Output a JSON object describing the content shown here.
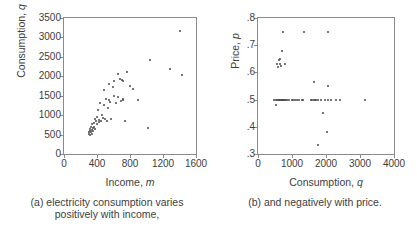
{
  "figure": {
    "panels": [
      {
        "id": "a",
        "caption_line1": "(a) electricity consumption varies",
        "caption_line2": "positively with income,",
        "y_axis_title_main": "Consumption,",
        "y_axis_title_var": "q",
        "x_axis_title_main": "Income,",
        "x_axis_title_var": "m"
      },
      {
        "id": "b",
        "caption_line1": "(b) and negatively with price.",
        "caption_line2": "",
        "y_axis_title_main": "Price,",
        "y_axis_title_var": "p",
        "x_axis_title_main": "Consumption,",
        "x_axis_title_var": "q"
      }
    ]
  },
  "chart_data": [
    {
      "type": "scatter",
      "panel": "a",
      "title": "(a) electricity consumption varies positively with income,",
      "xlabel": "Income, m",
      "ylabel": "Consumption, q",
      "xlim": [
        0,
        1600
      ],
      "ylim": [
        0,
        3500
      ],
      "xticks": [
        0,
        400,
        800,
        1200,
        1600
      ],
      "yticks": [
        0,
        500,
        1000,
        1500,
        2000,
        2500,
        3000,
        3500
      ],
      "xtick_labels": [
        "0",
        "400",
        "800",
        "1200",
        "1600"
      ],
      "ytick_labels": [
        "0",
        "500",
        "1000",
        "1500",
        "2000",
        "2500",
        "3000",
        "3500"
      ],
      "grid": false,
      "legend": null,
      "marker_color": "#4a4a4a",
      "points": [
        [
          300,
          560
        ],
        [
          305,
          520
        ],
        [
          310,
          600
        ],
        [
          315,
          480
        ],
        [
          318,
          640
        ],
        [
          322,
          560
        ],
        [
          330,
          700
        ],
        [
          335,
          620
        ],
        [
          340,
          520
        ],
        [
          345,
          760
        ],
        [
          350,
          660
        ],
        [
          355,
          580
        ],
        [
          360,
          800
        ],
        [
          365,
          700
        ],
        [
          370,
          900
        ],
        [
          380,
          640
        ],
        [
          390,
          860
        ],
        [
          395,
          760
        ],
        [
          400,
          960
        ],
        [
          410,
          1120
        ],
        [
          420,
          820
        ],
        [
          430,
          880
        ],
        [
          440,
          1320
        ],
        [
          450,
          860
        ],
        [
          460,
          1000
        ],
        [
          470,
          920
        ],
        [
          480,
          1640
        ],
        [
          490,
          1260
        ],
        [
          500,
          900
        ],
        [
          510,
          1420
        ],
        [
          520,
          860
        ],
        [
          530,
          1180
        ],
        [
          540,
          1800
        ],
        [
          550,
          1400
        ],
        [
          560,
          1340
        ],
        [
          575,
          900
        ],
        [
          590,
          1720
        ],
        [
          600,
          1500
        ],
        [
          610,
          1880
        ],
        [
          630,
          1300
        ],
        [
          650,
          1460
        ],
        [
          660,
          2060
        ],
        [
          680,
          1940
        ],
        [
          690,
          1360
        ],
        [
          700,
          1900
        ],
        [
          710,
          1880
        ],
        [
          715,
          1400
        ],
        [
          720,
          1420
        ],
        [
          740,
          840
        ],
        [
          760,
          2120
        ],
        [
          800,
          1760
        ],
        [
          840,
          1660
        ],
        [
          900,
          1400
        ],
        [
          1020,
          680
        ],
        [
          1040,
          2420
        ],
        [
          1280,
          2200
        ],
        [
          1400,
          3160
        ],
        [
          1430,
          2040
        ]
      ]
    },
    {
      "type": "scatter",
      "panel": "b",
      "title": "(b) and negatively with price.",
      "xlabel": "Consumption, q",
      "ylabel": "Price, p",
      "xlim": [
        0,
        4000
      ],
      "ylim": [
        0.3,
        0.8
      ],
      "xticks": [
        0,
        1000,
        2000,
        3000,
        4000
      ],
      "yticks": [
        0.3,
        0.4,
        0.5,
        0.6,
        0.7,
        0.8
      ],
      "xtick_labels": [
        "0",
        "1000",
        "2000",
        "3000",
        "4000"
      ],
      "ytick_labels": [
        ".3",
        ".4",
        ".5",
        ".6",
        ".7",
        ".8"
      ],
      "grid": false,
      "legend": null,
      "marker_color": "#4a4a4a",
      "points": [
        [
          480,
          0.5
        ],
        [
          520,
          0.5
        ],
        [
          540,
          0.48
        ],
        [
          560,
          0.5
        ],
        [
          600,
          0.5
        ],
        [
          620,
          0.5
        ],
        [
          640,
          0.5
        ],
        [
          660,
          0.5
        ],
        [
          680,
          0.5
        ],
        [
          700,
          0.5
        ],
        [
          720,
          0.5
        ],
        [
          740,
          0.5
        ],
        [
          760,
          0.5
        ],
        [
          790,
          0.5
        ],
        [
          820,
          0.5
        ],
        [
          860,
          0.5
        ],
        [
          900,
          0.5
        ],
        [
          1000,
          0.5
        ],
        [
          1040,
          0.5
        ],
        [
          1080,
          0.5
        ],
        [
          1160,
          0.5
        ],
        [
          1200,
          0.5
        ],
        [
          1280,
          0.5
        ],
        [
          1320,
          0.5
        ],
        [
          1560,
          0.5
        ],
        [
          1600,
          0.5
        ],
        [
          1640,
          0.5
        ],
        [
          1680,
          0.5
        ],
        [
          1720,
          0.5
        ],
        [
          1760,
          0.5
        ],
        [
          1840,
          0.5
        ],
        [
          1960,
          0.5
        ],
        [
          2060,
          0.5
        ],
        [
          2160,
          0.5
        ],
        [
          2300,
          0.5
        ],
        [
          2420,
          0.5
        ],
        [
          3160,
          0.5
        ],
        [
          560,
          0.63
        ],
        [
          580,
          0.62
        ],
        [
          620,
          0.645
        ],
        [
          640,
          0.65
        ],
        [
          660,
          0.63
        ],
        [
          680,
          0.625
        ],
        [
          700,
          0.68
        ],
        [
          780,
          0.63
        ],
        [
          740,
          0.75
        ],
        [
          1340,
          0.75
        ],
        [
          2060,
          0.75
        ],
        [
          1660,
          0.565
        ],
        [
          2060,
          0.55
        ],
        [
          1920,
          0.45
        ],
        [
          2020,
          0.382
        ],
        [
          1760,
          0.332
        ]
      ]
    }
  ]
}
